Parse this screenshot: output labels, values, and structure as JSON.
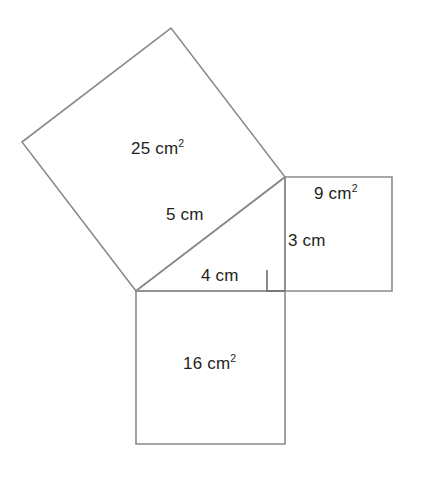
{
  "figure": {
    "stroke_color": "#8b8b8b",
    "text_color": "#231f20",
    "background_color": "#ffffff",
    "labels": {
      "area_hypotenuse_value": "25",
      "area_hypotenuse_unit": "cm",
      "area_hypotenuse_exponent": "2",
      "area_vertical_value": "9",
      "area_vertical_unit": "cm",
      "area_vertical_exponent": "2",
      "area_base_value": "16",
      "area_base_unit": "cm",
      "area_base_exponent": "2",
      "side_hypotenuse": "5 cm",
      "side_vertical": "3 cm",
      "side_base": "4 cm"
    },
    "geometry": {
      "triangle": {
        "left_vertex": "136,291",
        "top_vertex": "285,177",
        "right_angle_vertex": "285,291"
      },
      "square_25_points": "136,291 22,142 171,28 285,177",
      "square_9_points": "285,177 392,177 392,291 285,291",
      "square_16_points": "136,291 285,291 285,444 136,444",
      "right_angle_marker": "267,270 267,291 285,291"
    }
  }
}
